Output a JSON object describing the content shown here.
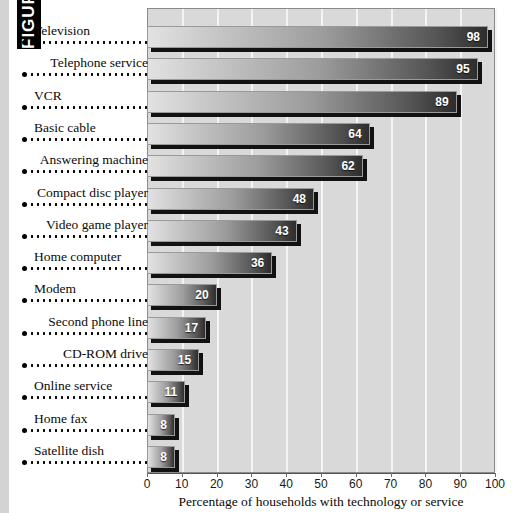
{
  "figure_tab": {
    "label": "FIGURE 1.1"
  },
  "chart_data": {
    "type": "bar",
    "orientation": "horizontal",
    "title": "",
    "xlabel": "Percentage of households with technology or service",
    "ylabel": "",
    "xlim": [
      0,
      100
    ],
    "xticks": [
      0,
      10,
      20,
      30,
      40,
      50,
      60,
      70,
      80,
      90,
      100
    ],
    "grid": "vertical-white-gridlines",
    "legend": "none",
    "categories": [
      "Television",
      "Telephone service",
      "VCR",
      "Basic cable",
      "Answering machine",
      "Compact disc player",
      "Video game player",
      "Home computer",
      "Modem",
      "Second phone line",
      "CD-ROM drive",
      "Online service",
      "Home fax",
      "Satellite dish"
    ],
    "values": [
      98,
      95,
      89,
      64,
      62,
      48,
      43,
      36,
      20,
      17,
      15,
      11,
      8,
      8
    ]
  },
  "colors": {
    "plot_background": "#d9d9d9",
    "gridline": "#f4f4f4",
    "bar_light": "#e2e2e2",
    "bar_dark": "#2d2d2d",
    "bar_shadow": "#121212",
    "value_text": "#ffffff",
    "page_background": "#ffffff",
    "gutter": "#d3d3d3"
  }
}
